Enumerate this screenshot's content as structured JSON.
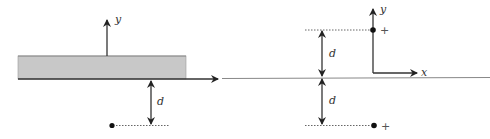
{
  "figure": {
    "left_panel": {
      "slab_fill": "#c8c8c8",
      "axis_label_y": "y",
      "distance_label": "d"
    },
    "right_panel": {
      "axis_label_y": "y",
      "axis_label_x": "x",
      "distance_label_upper": "d",
      "distance_label_lower": "d",
      "charge_upper": "+",
      "charge_lower": "+"
    },
    "colors": {
      "line": "#333333",
      "thin_line": "#777777",
      "dotted": "#555555"
    }
  }
}
